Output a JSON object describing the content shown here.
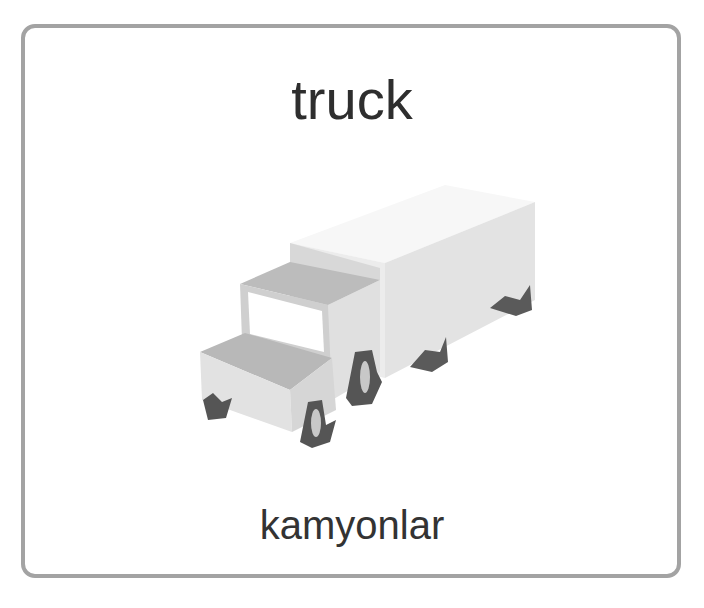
{
  "card": {
    "title": "truck",
    "translation": "kamyonlar",
    "image": {
      "icon": "truck-illustration",
      "alt": "truck"
    }
  },
  "colors": {
    "border": "#a3a3a3",
    "text": "#2e2e2e",
    "truck_light": "#e6e6e6",
    "truck_mid": "#bdbdbd",
    "wheel": "#555555"
  }
}
